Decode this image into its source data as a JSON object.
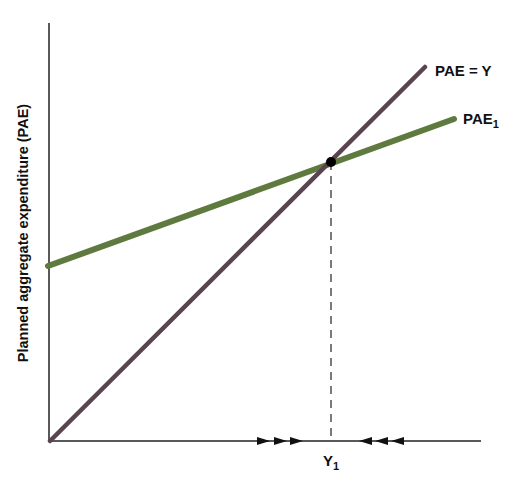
{
  "diagram": {
    "y_axis_label": "Planned aggregate expenditure (PAE)",
    "x_tick_label": {
      "main": "Y",
      "sub": "1"
    },
    "lines": [
      {
        "name": "PAE = Y",
        "label_main": "PAE = Y",
        "label_sub": "",
        "color": "#5a4450"
      },
      {
        "name": "PAE1",
        "label_main": "PAE",
        "label_sub": "1",
        "color": "#5f7a3e"
      }
    ],
    "equilibrium_point": "intersection of PAE = Y and PAE1 at Y1",
    "arrows": {
      "left_group": "three arrows pointing right",
      "right_group": "three arrows pointing left"
    },
    "colors": {
      "axis": "#222222",
      "purple_line": "#5a4450",
      "green_line": "#5f7a3e",
      "point": "#000000"
    }
  }
}
